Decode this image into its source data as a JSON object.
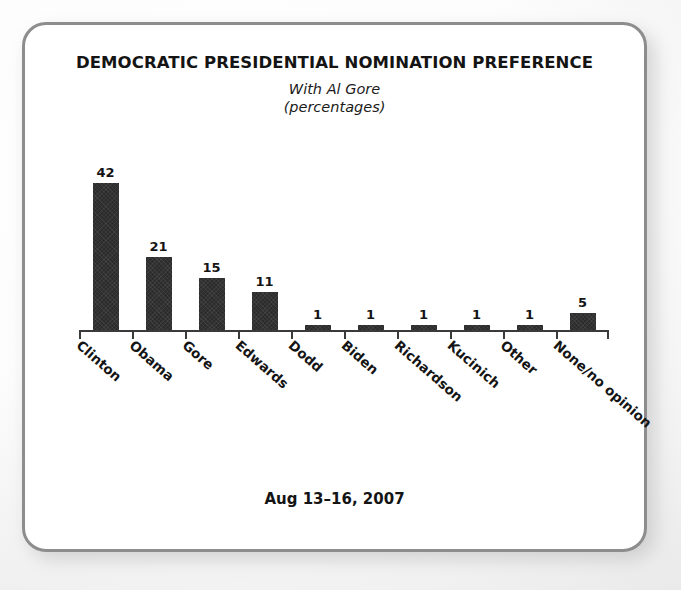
{
  "chart_data": {
    "type": "bar",
    "title": "DEMOCRATIC PRESIDENTIAL NOMINATION PREFERENCE",
    "subtitle": "With Al Gore",
    "units_note": "(percentages)",
    "footer": "Aug 13–16, 2007",
    "categories": [
      "Clinton",
      "Obama",
      "Gore",
      "Edwards",
      "Dodd",
      "Biden",
      "Richardson",
      "Kucinich",
      "Other",
      "None/no opinion"
    ],
    "values": [
      42,
      21,
      15,
      11,
      1,
      1,
      1,
      1,
      1,
      5
    ],
    "xlabel": "",
    "ylabel": "",
    "ylim": [
      0,
      42
    ],
    "grid": false,
    "legend": false,
    "bar_color": "#2c2c2c",
    "axis_color": "#3a3a3a",
    "show_value_labels": true,
    "label_rotation_deg": 41
  },
  "frame": {
    "border_color": "#8d8d8d",
    "background_color": "#ffffff"
  }
}
